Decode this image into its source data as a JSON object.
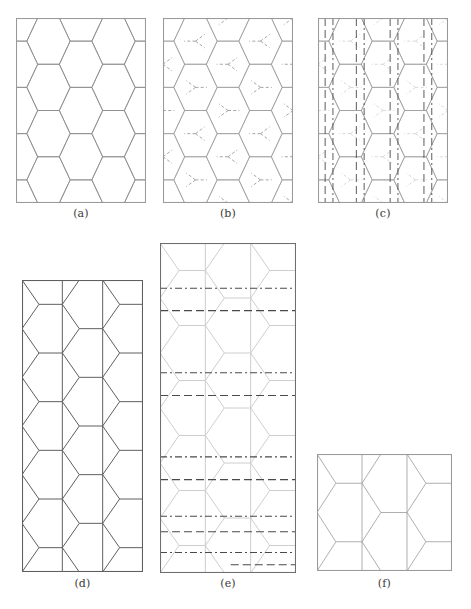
{
  "figure": {
    "width": 471,
    "height": 609,
    "background_color": "#ffffff",
    "mesh_line_color": "#8a8a8a",
    "mesh_line_color_light": "#c2c2c2",
    "frame_color_dark": "#6e6e6e",
    "frame_color_light": "#9a9a9a",
    "overlay_line_color": "#4a4a4a",
    "caption_color": "#3a3a3a"
  },
  "panels": [
    {
      "id": "a",
      "caption": "(a)",
      "x": 16,
      "y": 18,
      "w": 130,
      "h": 185,
      "frame_color": "#9a9a9a",
      "mesh_color": "#8a8a8a",
      "mesh_width": 0.8,
      "caption_x": 16,
      "caption_y": 208,
      "description": "plain hexagonal honeycomb mesh clipped to rectangular frame",
      "overlay": "none"
    },
    {
      "id": "b",
      "caption": "(b)",
      "x": 163,
      "y": 18,
      "w": 130,
      "h": 185,
      "frame_color": "#9a9a9a",
      "mesh_color": "#9a9a9a",
      "mesh_width": 0.7,
      "caption_x": 163,
      "caption_y": 208,
      "description": "honeycomb mesh with dashed dual-graph Y connectors at cell centers",
      "overlay": "dual-graph-dashed"
    },
    {
      "id": "c",
      "caption": "(c)",
      "x": 318,
      "y": 18,
      "w": 130,
      "h": 185,
      "frame_color": "#9a9a9a",
      "mesh_color": "#9a9a9a",
      "mesh_width": 0.7,
      "caption_x": 318,
      "caption_y": 208,
      "description": "honeycomb mesh with vertical dashed and dash-dot partition lines",
      "overlay": "vertical-cuts"
    },
    {
      "id": "d",
      "caption": "(d)",
      "x": 22,
      "y": 280,
      "w": 121,
      "h": 292,
      "frame_color": "#5f5f5f",
      "mesh_color": "#5f5f5f",
      "mesh_width": 1.0,
      "caption_x": 22,
      "caption_y": 578,
      "description": "vertically stretched honeycomb mesh, three column strips",
      "overlay": "none"
    },
    {
      "id": "e",
      "caption": "(e)",
      "x": 160,
      "y": 243,
      "w": 136,
      "h": 330,
      "frame_color": "#6e6e6e",
      "mesh_color": "#c8c8c8",
      "mesh_width": 0.9,
      "caption_x": 160,
      "caption_y": 578,
      "description": "stretched honeycomb mesh in light gray with horizontal dashed and dash-dot partition lines",
      "overlay": "horizontal-cuts"
    },
    {
      "id": "f",
      "caption": "(f)",
      "x": 317,
      "y": 454,
      "w": 135,
      "h": 117,
      "frame_color": "#9a9a9a",
      "mesh_color": "#9a9a9a",
      "mesh_width": 0.8,
      "caption_x": 317,
      "caption_y": 578,
      "description": "compressed coarse honeycomb mesh, two rows by three columns",
      "overlay": "none"
    }
  ],
  "geometry": {
    "hex_columns": 4,
    "hex_rows": 4,
    "panel_c_vertical_cuts": [
      {
        "x_frac": 0.055,
        "style": "dashed"
      },
      {
        "x_frac": 0.115,
        "style": "dashdot"
      },
      {
        "x_frac": 0.295,
        "style": "dashed"
      },
      {
        "x_frac": 0.355,
        "style": "dashdot"
      },
      {
        "x_frac": 0.555,
        "style": "dashed"
      },
      {
        "x_frac": 0.615,
        "style": "dashdot"
      },
      {
        "x_frac": 0.815,
        "style": "dashed"
      },
      {
        "x_frac": 0.875,
        "style": "dashdot"
      }
    ],
    "panel_e_horizontal_cuts": [
      {
        "y_frac": 0.137,
        "style": "dashdot"
      },
      {
        "y_frac": 0.205,
        "style": "dashed"
      },
      {
        "y_frac": 0.393,
        "style": "dashdot"
      },
      {
        "y_frac": 0.462,
        "style": "dashed"
      },
      {
        "y_frac": 0.648,
        "style": "dashdot"
      },
      {
        "y_frac": 0.717,
        "style": "dashed"
      },
      {
        "y_frac": 0.828,
        "style": "dashdot"
      },
      {
        "y_frac": 0.875,
        "style": "dashed"
      },
      {
        "y_frac": 0.938,
        "style": "dashdot"
      },
      {
        "y_frac": 0.975,
        "style": "dashed-partial"
      }
    ]
  }
}
